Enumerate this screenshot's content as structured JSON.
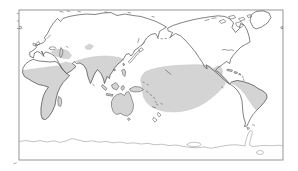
{
  "figure": {
    "type": "world-map",
    "projection": "pacific-centered-world",
    "colors": {
      "page_bg": "#ffffff",
      "frame": "#8a8a8a",
      "coastline": "#4d4d4d",
      "antarctica_line": "#9a9a9a",
      "shade": "#d4d4d4",
      "shade_edge": "#c3c3c3"
    },
    "shaded_regions": [
      {
        "name": "sub-saharan-africa"
      },
      {
        "name": "madagascar"
      },
      {
        "name": "middle-east"
      },
      {
        "name": "southern-arabia"
      },
      {
        "name": "central-asia-patch"
      },
      {
        "name": "south-asia-southeast-asia"
      },
      {
        "name": "maritime-southeast-asia"
      },
      {
        "name": "new-guinea"
      },
      {
        "name": "australia-tasmania"
      },
      {
        "name": "tropical-pacific-ocean"
      },
      {
        "name": "central-america-caribbean"
      },
      {
        "name": "northern-south-america"
      }
    ]
  }
}
